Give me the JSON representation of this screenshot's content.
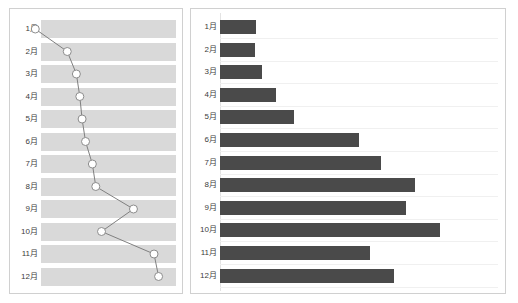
{
  "chart_data": [
    {
      "id": "line-chart",
      "type": "line",
      "title": "",
      "xlabel": "",
      "ylabel": "",
      "orientation": "vertical-category-axis",
      "grid": "alternating-row-bands",
      "legend": "none",
      "categories": [
        "1月",
        "2月",
        "3月",
        "4月",
        "5月",
        "6月",
        "7月",
        "8月",
        "9月",
        "10月",
        "11月",
        "12月"
      ],
      "values": [
        2,
        30,
        38,
        41,
        43,
        46,
        52,
        55,
        88,
        60,
        106,
        110
      ],
      "xlim": [
        0,
        120
      ],
      "marker": "open-circle",
      "line_color": "#808080",
      "marker_fill": "#ffffff",
      "marker_stroke": "#8c8c8c",
      "band_color": "#d9d9d9"
    },
    {
      "id": "bar-chart",
      "type": "bar",
      "title": "",
      "xlabel": "",
      "ylabel": "",
      "orientation": "horizontal",
      "grid": "faint-horizontal",
      "legend": "none",
      "categories": [
        "1月",
        "2月",
        "3月",
        "4月",
        "5月",
        "6月",
        "7月",
        "8月",
        "9月",
        "10月",
        "11月",
        "12月"
      ],
      "values": [
        37,
        36,
        43,
        58,
        76,
        144,
        166,
        201,
        192,
        227,
        155,
        180
      ],
      "xlim": [
        0,
        287
      ],
      "bar_color": "#4a4a4a",
      "gridline_color": "#f0f0f0"
    }
  ],
  "panels": {
    "line": {
      "name": "monthly-trend-line-chart"
    },
    "bar": {
      "name": "monthly-values-bar-chart"
    }
  }
}
